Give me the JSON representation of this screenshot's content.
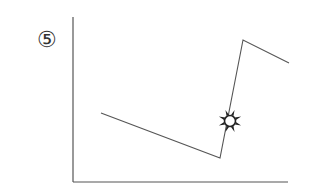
{
  "figure": {
    "label": "⑤",
    "marker_icon": "sun-burst-icon"
  },
  "colors": {
    "axis": "#555555",
    "line": "#555555",
    "marker": "#222222",
    "background": "#ffffff"
  },
  "chart_data": {
    "type": "line",
    "title": "",
    "xlabel": "",
    "ylabel": "",
    "grid": false,
    "legend": null,
    "axes": {
      "origin": [
        73,
        182
      ],
      "y_axis_top": [
        73,
        17
      ],
      "x_axis_right": [
        288,
        182
      ]
    },
    "series": [
      {
        "name": "curve",
        "points_px": [
          [
            101,
            113
          ],
          [
            220,
            158
          ],
          [
            243,
            40
          ],
          [
            289,
            63
          ]
        ]
      }
    ],
    "annotations": [
      {
        "type": "marker",
        "shape": "sun-burst",
        "at_px": [
          230,
          121
        ]
      }
    ]
  }
}
